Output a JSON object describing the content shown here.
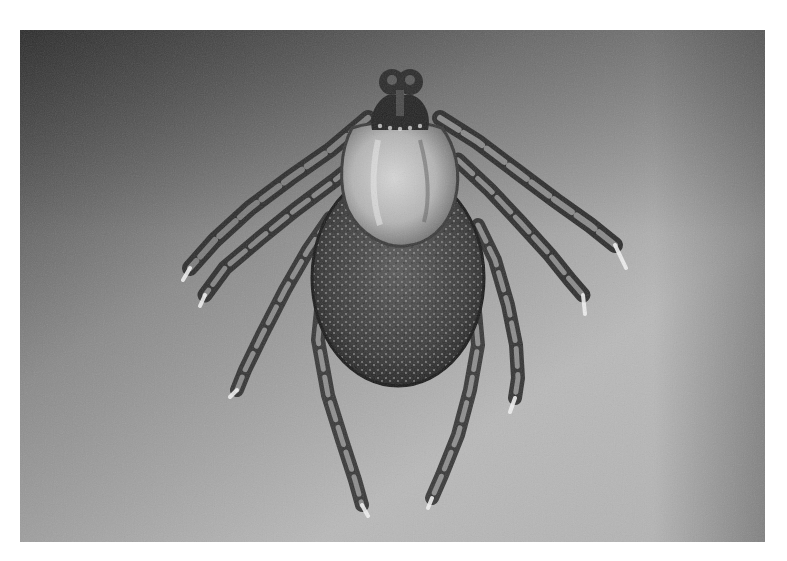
{
  "image": {
    "subject": "Tick (dorsal view)",
    "alt": "Grayscale macro photograph of a hard tick viewed from above, showing mouthparts, light scutum, speckled body and eight legs on a gray gradient background",
    "colors": {
      "page_background": "#ffffff",
      "backdrop_dark": "#3a3a3a",
      "backdrop_mid": "#9a9a9a",
      "backdrop_light": "#bcbcbc",
      "body_dark": "#2e2e2e",
      "scutum_light": "#c9c9c9",
      "leg_mid": "#5a5a5a",
      "leg_tip_highlight": "#f2f2f2"
    },
    "parts": {
      "capitulum": "mouthparts",
      "scutum": "dorsal shield",
      "alloscutum": "body",
      "legs": 8
    }
  }
}
